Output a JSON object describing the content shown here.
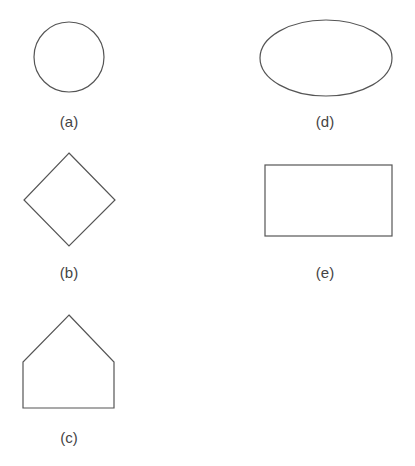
{
  "figure": {
    "panels": [
      {
        "id": "a",
        "label": "(a)",
        "shape": "circle",
        "cx": 69,
        "cy": 57,
        "r": 35,
        "label_x": 69,
        "label_y": 127
      },
      {
        "id": "b",
        "label": "(b)",
        "shape": "diamond",
        "points": "69,153 115,200 69,246 24,200",
        "label_x": 69,
        "label_y": 278
      },
      {
        "id": "c",
        "label": "(c)",
        "shape": "pentagon",
        "points": "69,315 114,362 114,408 23,408 23,362",
        "label_x": 69,
        "label_y": 443
      },
      {
        "id": "d",
        "label": "(d)",
        "shape": "ellipse",
        "cx": 326,
        "cy": 58,
        "rx": 66,
        "ry": 38,
        "label_x": 325,
        "label_y": 127
      },
      {
        "id": "e",
        "label": "(e)",
        "shape": "rectangle",
        "x": 265,
        "y": 165,
        "width": 127,
        "height": 71,
        "label_x": 325,
        "label_y": 278
      }
    ],
    "stroke_color": "#555555",
    "label_color": "#444444"
  }
}
